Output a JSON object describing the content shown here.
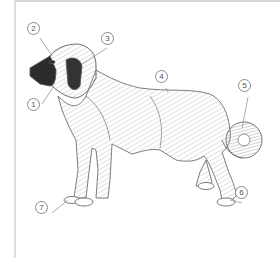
{
  "figure": {
    "callouts": [
      {
        "number": "1",
        "x": 32,
        "y": 104
      },
      {
        "number": "2",
        "x": 32,
        "y": 28
      },
      {
        "number": "3",
        "x": 107,
        "y": 38
      },
      {
        "number": "4",
        "x": 160,
        "y": 76
      },
      {
        "number": "5",
        "x": 243,
        "y": 85
      },
      {
        "number": "6",
        "x": 240,
        "y": 192
      },
      {
        "number": "7",
        "x": 41,
        "y": 207
      }
    ]
  },
  "colors": {
    "line": "#6e6e6e",
    "shade": "#9a9a9a",
    "dark": "#2b2b2b",
    "frame": "#d8d8d8"
  }
}
